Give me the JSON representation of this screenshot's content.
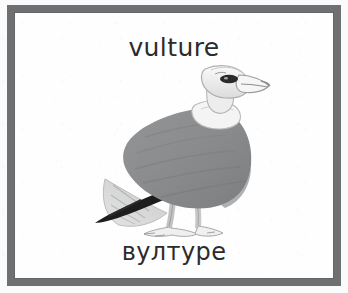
{
  "card": {
    "caption_top": "vulture",
    "caption_bottom": "вултуре",
    "border_color": "#6f7072",
    "background_color": "#fefefe",
    "text_color": "#2b2b2b"
  },
  "illustration": {
    "subject": "vulture",
    "style": "grayscale watercolor sketch",
    "colors": {
      "body_gray": "#8d8e90",
      "body_gray_dark": "#7a7b7d",
      "wingtip_black": "#1d1d1d",
      "head_white": "#f2f2f2",
      "outline_gray": "#9a9a9a",
      "leg_light": "#e6e6e6",
      "eye_dark": "#2a2a2a"
    },
    "parts": [
      "head",
      "beak",
      "eye",
      "neck-ruff",
      "body",
      "wing",
      "black-wingtip",
      "tail-feathers",
      "legs",
      "feet"
    ]
  }
}
